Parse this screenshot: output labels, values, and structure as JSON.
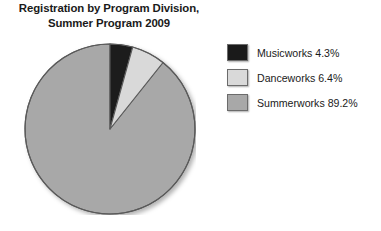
{
  "chart_data": {
    "type": "pie",
    "title": "Registration by Program Division, Summer Program 2009",
    "title_lines": [
      "Registration by Program Division,",
      "Summer Program 2009"
    ],
    "categories": [
      "Musicworks",
      "Danceworks",
      "Summerworks"
    ],
    "values": [
      4.3,
      6.4,
      89.2
    ],
    "value_unit": "%",
    "labels": [
      "Musicworks 4.3%",
      "Danceworks 6.4%",
      "Summerworks 89.2%"
    ],
    "colors": [
      "#1a1a1a",
      "#d9d9d9",
      "#a8a8a8"
    ],
    "start_angle_deg": 0,
    "direction": "clockwise",
    "legend_position": "right",
    "grid": false,
    "xlabel": "",
    "ylabel": ""
  },
  "legend": {
    "items": [
      {
        "label": "Musicworks 4.3%",
        "name": "Musicworks",
        "value": "4.3%",
        "color": "#1a1a1a"
      },
      {
        "label": "Danceworks 6.4%",
        "name": "Danceworks",
        "value": "6.4%",
        "color": "#d9d9d9"
      },
      {
        "label": "Summerworks 89.2%",
        "name": "Summerworks",
        "value": "89.2%",
        "color": "#a8a8a8"
      }
    ]
  },
  "pie": {
    "slices": [
      {
        "name": "Musicworks",
        "percent": 4.3,
        "color": "#1a1a1a"
      },
      {
        "name": "Danceworks",
        "percent": 6.4,
        "color": "#d9d9d9"
      },
      {
        "name": "Summerworks",
        "percent": 89.2,
        "color": "#a8a8a8"
      }
    ],
    "outline_color": "#5a5a5a"
  }
}
